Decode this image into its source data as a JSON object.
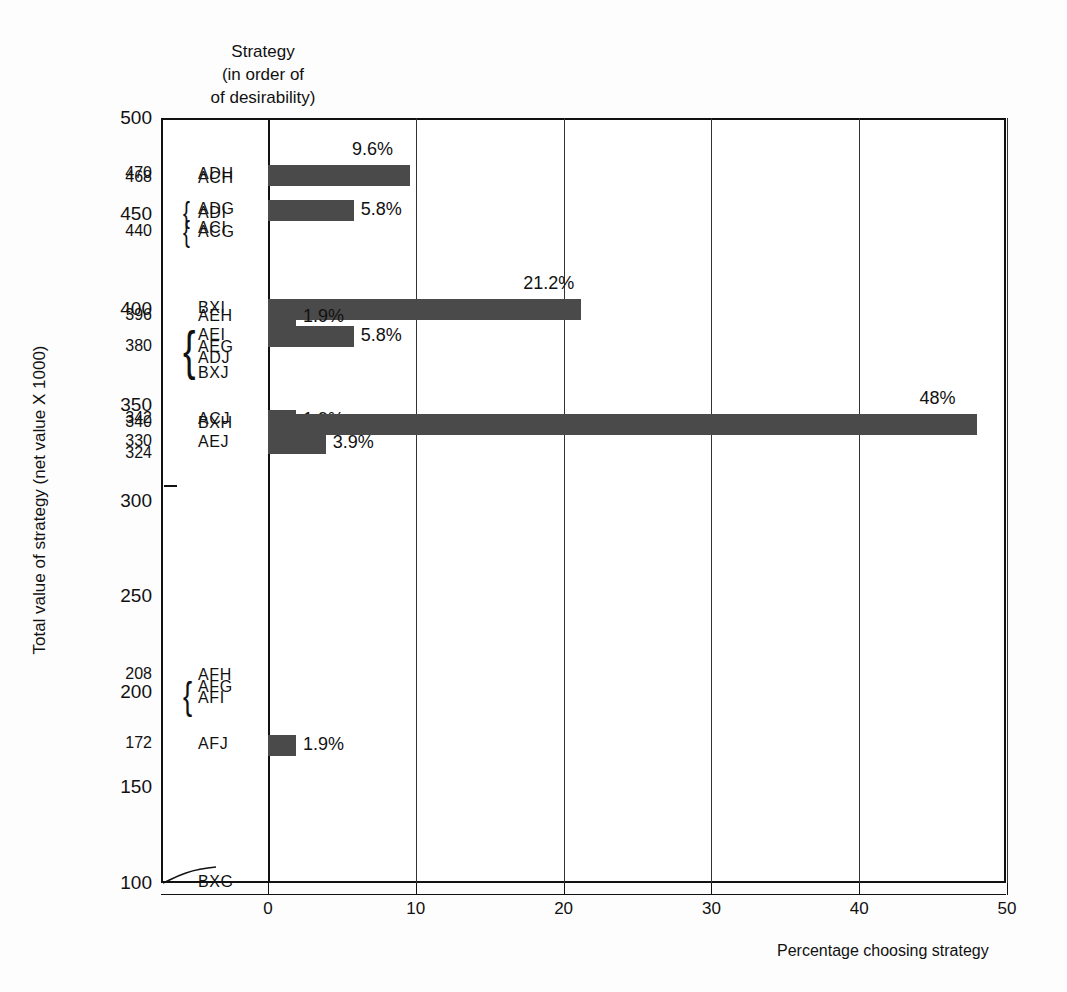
{
  "chart_data": {
    "type": "bar",
    "orientation": "horizontal",
    "title": "",
    "column_header": [
      "Strategy",
      "(in order of",
      "of desirability)"
    ],
    "xlabel": "Percentage choosing strategy",
    "ylabel": "Total value of strategy (net value X 1000)",
    "xlim": [
      0,
      50
    ],
    "xticks": [
      0,
      10,
      20,
      30,
      40,
      50
    ],
    "xtick_labels": [
      "0",
      "10",
      "20",
      "30",
      "40",
      "50"
    ],
    "ylim": [
      100,
      500
    ],
    "grid": "vertical",
    "legend": "none",
    "bar_color": "#4a4a4a",
    "y_major_ticks": [
      {
        "value": 500,
        "label": "500"
      },
      {
        "value": 450,
        "label": "450"
      },
      {
        "value": 400,
        "label": "400"
      },
      {
        "value": 350,
        "label": "350"
      },
      {
        "value": 300,
        "label": "300"
      },
      {
        "value": 250,
        "label": "250"
      },
      {
        "value": 200,
        "label": "200"
      },
      {
        "value": 150,
        "label": "150"
      },
      {
        "value": 100,
        "label": "100"
      }
    ],
    "y_minor_ticks": [
      {
        "value": 470,
        "label": "470"
      },
      {
        "value": 468,
        "label": "468"
      },
      {
        "value": 440,
        "label": "440"
      },
      {
        "value": 396,
        "label": "396"
      },
      {
        "value": 380,
        "label": "380"
      },
      {
        "value": 342,
        "label": "342"
      },
      {
        "value": 340,
        "label": "340"
      },
      {
        "value": 330,
        "label": "330"
      },
      {
        "value": 324,
        "label": "324"
      },
      {
        "value": 208,
        "label": "208"
      },
      {
        "value": 172,
        "label": "172"
      }
    ],
    "strategies": [
      {
        "code": "ADH",
        "net_value": 470,
        "percentage": 9.6,
        "label": "9.6%",
        "has_bar": true
      },
      {
        "code": "ACH",
        "net_value": 468,
        "percentage": null,
        "label": "",
        "has_bar": false
      },
      {
        "code": "ADG",
        "net_value": 452,
        "percentage": 5.8,
        "label": "5.8%",
        "has_bar": true
      },
      {
        "code": "ADI",
        "net_value": 450,
        "percentage": null,
        "label": "",
        "has_bar": false
      },
      {
        "code": "ACI",
        "net_value": 442,
        "percentage": null,
        "label": "",
        "has_bar": false
      },
      {
        "code": "ACG",
        "net_value": 440,
        "percentage": null,
        "label": "",
        "has_bar": false
      },
      {
        "code": "BXI",
        "net_value": 400,
        "percentage": 21.2,
        "label": "21.2%",
        "has_bar": true
      },
      {
        "code": "AEH",
        "net_value": 396,
        "percentage": 1.9,
        "label": "1.9%",
        "has_bar": true
      },
      {
        "code": "AEI",
        "net_value": 386,
        "percentage": 5.8,
        "label": "5.8%",
        "has_bar": true
      },
      {
        "code": "AEG",
        "net_value": 380,
        "percentage": null,
        "label": "",
        "has_bar": false
      },
      {
        "code": "ADJ",
        "net_value": 374,
        "percentage": null,
        "label": "",
        "has_bar": false
      },
      {
        "code": "BXJ",
        "net_value": 366,
        "percentage": null,
        "label": "",
        "has_bar": false
      },
      {
        "code": "ACJ",
        "net_value": 342,
        "percentage": 1.9,
        "label": "1.9%",
        "has_bar": true
      },
      {
        "code": "BXH",
        "net_value": 340,
        "percentage": 48,
        "label": "48%",
        "has_bar": true
      },
      {
        "code": "AEJ",
        "net_value": 330,
        "percentage": 3.9,
        "label": "3.9%",
        "has_bar": true
      },
      {
        "code": "AFH",
        "net_value": 208,
        "percentage": null,
        "label": "",
        "has_bar": false
      },
      {
        "code": "AFG",
        "net_value": 202,
        "percentage": null,
        "label": "",
        "has_bar": false
      },
      {
        "code": "AFI",
        "net_value": 196,
        "percentage": null,
        "label": "",
        "has_bar": false
      },
      {
        "code": "AFJ",
        "net_value": 172,
        "percentage": 1.9,
        "label": "1.9%",
        "has_bar": true
      },
      {
        "code": "BXG",
        "net_value": 100,
        "percentage": null,
        "label": "",
        "has_bar": false
      }
    ],
    "braces": [
      {
        "groups": [
          "ADG",
          "ADI"
        ]
      },
      {
        "groups": [
          "ACI",
          "ACG"
        ]
      },
      {
        "groups": [
          "AEI",
          "AEG",
          "ADJ"
        ]
      },
      {
        "groups": [
          "AFG",
          "AFI"
        ]
      }
    ]
  }
}
